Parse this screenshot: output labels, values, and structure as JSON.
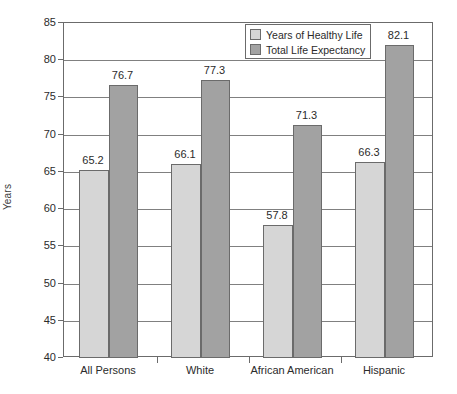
{
  "chart_data": {
    "type": "bar",
    "title": "",
    "subtitle": "",
    "xlabel": "",
    "ylabel": "Years",
    "ylim": [
      40,
      85
    ],
    "ytick_step": 5,
    "yticks": [
      85,
      80,
      75,
      70,
      65,
      60,
      55,
      50,
      45,
      40
    ],
    "grid": true,
    "legend_position": "top-right",
    "categories": [
      "All Persons",
      "White",
      "African American",
      "Hispanic"
    ],
    "series": [
      {
        "name": "Years of Healthy Life",
        "color": "#d6d6d6",
        "values": [
          65.2,
          66.1,
          57.8,
          66.3
        ],
        "labels": [
          "65.2",
          "66.1",
          "57.8",
          "66.3"
        ]
      },
      {
        "name": "Total Life Expectancy",
        "color": "#a2a2a2",
        "values": [
          76.7,
          77.3,
          71.3,
          82.1
        ],
        "labels": [
          "76.7",
          "77.3",
          "71.3",
          "82.1"
        ]
      }
    ]
  },
  "axis": {
    "y_title": "Years",
    "tick_labels": [
      "85",
      "80",
      "75",
      "70",
      "65",
      "60",
      "55",
      "50",
      "45",
      "40"
    ],
    "category_labels": [
      "All Persons",
      "White",
      "African American",
      "Hispanic"
    ]
  },
  "legend": {
    "items": [
      {
        "label": "Years of Healthy Life",
        "swatch": "light"
      },
      {
        "label": "Total Life Expectancy",
        "swatch": "dark"
      }
    ]
  },
  "colors": {
    "series_light": "#d6d6d6",
    "series_dark": "#a2a2a2",
    "axis_line": "#6b6b6b",
    "gridline": "#808080",
    "text": "#2b2b2b",
    "background": "#ffffff"
  }
}
